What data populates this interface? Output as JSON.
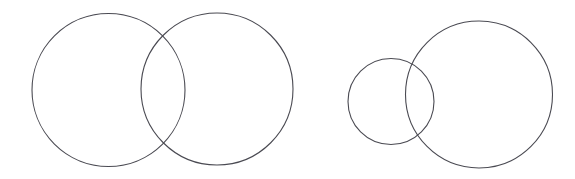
{
  "figure": {
    "background_color": "#ffffff",
    "stroke_color": "#4a4a52",
    "fill_color": "none",
    "stroke_width": 1.1,
    "width": 575,
    "height": 179
  },
  "groups": [
    {
      "name": "left-pair",
      "label": "Equal-size overlapping circles",
      "circles": [
        {
          "name": "left-pair-circle-a",
          "cx": 108.5,
          "cy": 90,
          "r": 76.5
        },
        {
          "name": "left-pair-circle-b",
          "cx": 217,
          "cy": 89,
          "r": 76
        }
      ]
    },
    {
      "name": "right-pair",
      "label": "Unequal-size overlapping circles",
      "circles": [
        {
          "name": "right-pair-circle-small",
          "cx": 391,
          "cy": 101.5,
          "r": 43
        },
        {
          "name": "right-pair-circle-large",
          "cx": 479,
          "cy": 94.5,
          "r": 73.5
        }
      ]
    }
  ],
  "chart_data": {
    "type": "scatter",
    "subtitle": "",
    "xlabel": "",
    "ylabel": "",
    "xlim": [
      0,
      575
    ],
    "ylim": [
      0,
      179
    ],
    "grid": false,
    "legend": "none",
    "annotations": [],
    "series": [
      {
        "name": "left-pair",
        "shape": "circle",
        "stroke": "#4a4a52",
        "fill": "none",
        "points": [
          {
            "label": "circle-a",
            "x": 108.5,
            "y": 90,
            "r": 76.5
          },
          {
            "label": "circle-b",
            "x": 217,
            "y": 89,
            "r": 76
          }
        ]
      },
      {
        "name": "right-pair",
        "shape": "circle",
        "stroke": "#4a4a52",
        "fill": "none",
        "points": [
          {
            "label": "circle-small",
            "x": 391,
            "y": 101.5,
            "r": 43
          },
          {
            "label": "circle-large",
            "x": 479,
            "y": 94.5,
            "r": 73.5
          }
        ]
      }
    ]
  }
}
